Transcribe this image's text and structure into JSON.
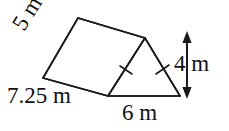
{
  "figure": {
    "name": "triangular-prism",
    "stroke_color": "#1a1a1a",
    "fill_color": "#ffffff",
    "text_color": "#111111",
    "background": "#ffffff",
    "labels": {
      "slant_edge": "5 m",
      "prism_length": "7.25 m",
      "triangle_base": "6 m",
      "triangle_height": "4 m"
    },
    "units": "m",
    "congruence_ticks": 2,
    "dimension_arrow": {
      "name": "height-arrow",
      "orientation": "vertical",
      "double_headed": true,
      "measures": "4 m"
    },
    "vertices": {
      "back_apex": [
        78,
        18
      ],
      "front_apex": [
        145,
        38
      ],
      "back_left_base": [
        43,
        78
      ],
      "front_left_base": [
        108,
        96
      ],
      "front_right_base": [
        180,
        96
      ]
    }
  }
}
